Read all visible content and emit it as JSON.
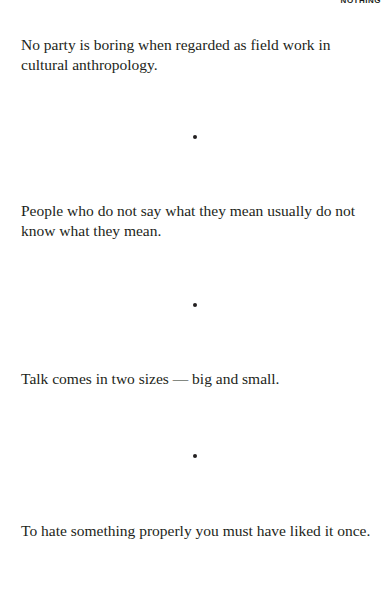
{
  "header": {
    "running_title": "NOTHING"
  },
  "quotes": [
    {
      "text": "No party is boring when regarded as field work in cultural anthropology."
    },
    {
      "text": "People who do not say what they mean usually do not know what they mean."
    },
    {
      "text": "Talk comes in two sizes — big and small."
    },
    {
      "text": "To hate something properly you must have liked it once."
    }
  ],
  "separator": {
    "glyph": "•",
    "count": 3
  }
}
